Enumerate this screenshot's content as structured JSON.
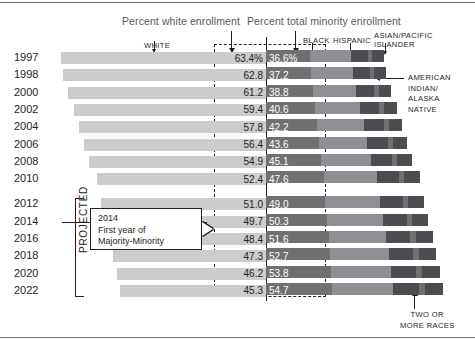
{
  "header": {
    "white_enrollment_label": "Percent white enrollment",
    "minority_enrollment_label": "Percent total minority enrollment"
  },
  "categories": {
    "white": "WHITE",
    "black": "BLACK",
    "hispanic": "HISPANIC",
    "asian_pacific_islander": "ASIAN/PACIFIC\nISLANDER",
    "american_indian": "AMERICAN\nINDIAN/\nALASKA\nNATIVE",
    "two_or_more": "TWO OR\nMORE RACES"
  },
  "projected_label": "PROJECTED",
  "callout": {
    "text": "2014\nFirst year of\nMajority-Minority"
  },
  "colors": {
    "white_bar": "#cccccc",
    "black_bar": "#6f7072",
    "hispanic_bar": "#8e9093",
    "api_bar": "#4b4d50",
    "two_bar": "#6f7072",
    "minority_value_bg": "#8e9093",
    "ink": "#231f20"
  },
  "chart_data": {
    "type": "bar",
    "title": "",
    "subtitle": "",
    "xlabel": "",
    "ylabel": "",
    "orientation": "horizontal",
    "stacked": true,
    "grid": false,
    "legend_position": "top",
    "xlim": [
      0,
      100
    ],
    "categories": [
      "1997",
      "1998",
      "2000",
      "2002",
      "2004",
      "2006",
      "2008",
      "2010",
      "2012",
      "2014",
      "2016",
      "2018",
      "2020",
      "2022"
    ],
    "series": [
      {
        "name": "Percent white enrollment",
        "values": [
          63.4,
          62.8,
          61.2,
          59.4,
          57.8,
          56.4,
          54.9,
          52.4,
          51.0,
          49.7,
          48.4,
          47.3,
          46.2,
          45.3
        ]
      },
      {
        "name": "Percent total minority enrollment",
        "values": [
          36.6,
          37.2,
          38.8,
          40.6,
          42.2,
          43.6,
          45.1,
          47.6,
          49.0,
          50.3,
          51.6,
          52.7,
          53.8,
          54.7
        ]
      }
    ],
    "value_labels": {
      "white": [
        "63.4%",
        "62.8",
        "61.2",
        "59.4",
        "57.8",
        "56.4",
        "54.9",
        "52.4",
        "51.0",
        "49.7",
        "48.4",
        "47.3",
        "46.2",
        "45.3"
      ],
      "minority": [
        "36.6%",
        "37.2",
        "38.8",
        "40.6",
        "42.2",
        "43.6",
        "45.1",
        "47.6",
        "49.0",
        "50.3",
        "51.6",
        "52.7",
        "53.8",
        "54.7"
      ]
    },
    "minority_breakdown_order": [
      "BLACK",
      "HISPANIC",
      "ASIAN/PACIFIC ISLANDER",
      "AMERICAN INDIAN/ALASKA NATIVE",
      "TWO OR MORE RACES"
    ],
    "projected_years": [
      "2012",
      "2014",
      "2016",
      "2018",
      "2020",
      "2022"
    ],
    "annotations": [
      {
        "year": "2014",
        "text": "2014 First year of Majority-Minority"
      }
    ]
  },
  "rows": [
    {
      "year": "1997",
      "white": "63.4%",
      "minority": "36.6%",
      "projected": false
    },
    {
      "year": "1998",
      "white": "62.8",
      "minority": "37.2",
      "projected": false
    },
    {
      "year": "2000",
      "white": "61.2",
      "minority": "38.8",
      "projected": false
    },
    {
      "year": "2002",
      "white": "59.4",
      "minority": "40.6",
      "projected": false
    },
    {
      "year": "2004",
      "white": "57.8",
      "minority": "42.2",
      "projected": false
    },
    {
      "year": "2006",
      "white": "56.4",
      "minority": "43.6",
      "projected": false
    },
    {
      "year": "2008",
      "white": "54.9",
      "minority": "45.1",
      "projected": false
    },
    {
      "year": "2010",
      "white": "52.4",
      "minority": "47.6",
      "projected": false
    },
    {
      "year": "2012",
      "white": "51.0",
      "minority": "49.0",
      "projected": true
    },
    {
      "year": "2014",
      "white": "49.7",
      "minority": "50.3",
      "projected": true
    },
    {
      "year": "2016",
      "white": "48.4",
      "minority": "51.6",
      "projected": true
    },
    {
      "year": "2018",
      "white": "47.3",
      "minority": "52.7",
      "projected": true
    },
    {
      "year": "2020",
      "white": "46.2",
      "minority": "53.8",
      "projected": true
    },
    {
      "year": "2022",
      "white": "45.3",
      "minority": "54.7",
      "projected": true
    }
  ]
}
